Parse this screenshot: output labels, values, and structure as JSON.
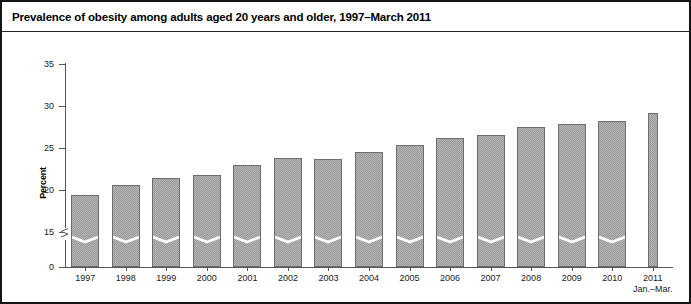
{
  "figure": {
    "title": "Prevalence of obesity among adults aged 20 years and older, 1997–March 2011"
  },
  "chart_data": {
    "type": "bar",
    "title": "Prevalence of obesity among adults aged 20 years and older, 1997–March 2011",
    "xlabel": "",
    "ylabel": "Percent",
    "categories": [
      "1997",
      "1998",
      "1999",
      "2000",
      "2001",
      "2002",
      "2003",
      "2004",
      "2005",
      "2006",
      "2007",
      "2008",
      "2009",
      "2010",
      "2011"
    ],
    "category_sublabels": [
      "",
      "",
      "",
      "",
      "",
      "",
      "",
      "",
      "",
      "",
      "",
      "",
      "",
      "",
      "Jan.–Mar."
    ],
    "values": [
      19.4,
      20.6,
      21.4,
      21.8,
      23.0,
      23.8,
      23.7,
      24.5,
      25.3,
      26.2,
      26.6,
      27.5,
      27.8,
      28.2,
      29.2
    ],
    "ylim": [
      0,
      35
    ],
    "yticks": [
      0,
      15,
      20,
      25,
      30,
      35
    ],
    "ytick_labels": [
      "0",
      "15",
      "20",
      "25",
      "30",
      "35"
    ],
    "axis_break": {
      "present": true,
      "between": [
        0,
        15
      ],
      "note": "y-axis is broken between 0 and 15; bars carry a white chevron break mark"
    },
    "grid": false,
    "legend": null,
    "bar_color": "#b4b4b4",
    "bar_edge_color": "#6d6d6d",
    "last_bar_narrow": true
  }
}
